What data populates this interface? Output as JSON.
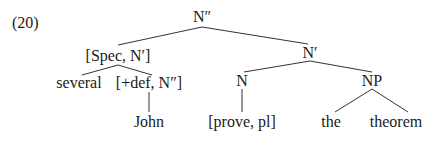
{
  "example_number": "(20)",
  "tree": {
    "root": {
      "label": "N″",
      "x": 202,
      "y": 9
    },
    "spec": {
      "label": "[Spec, N′]",
      "x": 118,
      "y": 47
    },
    "nbar": {
      "label": "N′",
      "x": 310,
      "y": 44
    },
    "several": {
      "label": "several",
      "x": 79,
      "y": 74
    },
    "def": {
      "label": "[+def, N″]",
      "x": 149,
      "y": 74
    },
    "n": {
      "label": "N",
      "x": 242,
      "y": 72
    },
    "np": {
      "label": "NP",
      "x": 372,
      "y": 72
    },
    "john": {
      "label": "John",
      "x": 149,
      "y": 113
    },
    "prove": {
      "label": "[prove, pl]",
      "x": 242,
      "y": 113
    },
    "the": {
      "label": "the",
      "x": 331,
      "y": 113
    },
    "theorem": {
      "label": "theorem",
      "x": 396,
      "y": 113
    }
  },
  "edges": [
    [
      "root",
      "spec"
    ],
    [
      "root",
      "nbar"
    ],
    [
      "spec",
      "several"
    ],
    [
      "spec",
      "def"
    ],
    [
      "def",
      "john"
    ],
    [
      "nbar",
      "n"
    ],
    [
      "nbar",
      "np"
    ],
    [
      "n",
      "prove"
    ],
    [
      "np",
      "the"
    ],
    [
      "np",
      "theorem"
    ]
  ]
}
